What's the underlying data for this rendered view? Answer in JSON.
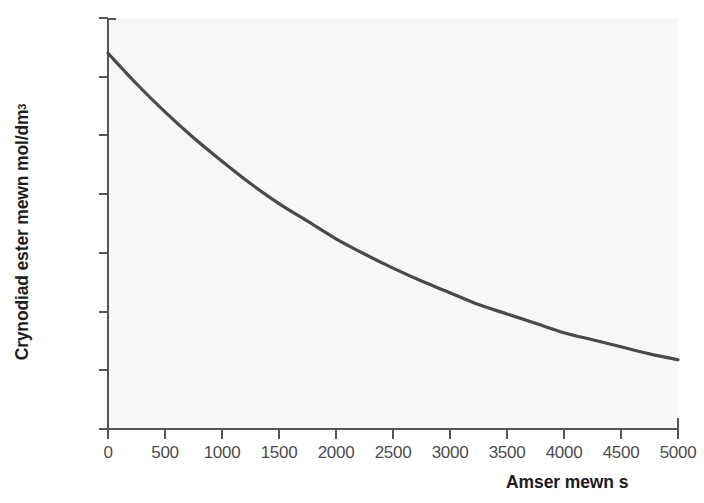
{
  "chart_data": {
    "type": "line",
    "title": "",
    "xlabel": "Amser mewn s",
    "ylabel_text": "Crynodiad ester mewn mol/dm",
    "ylabel_sup": "3",
    "xlim": [
      0,
      5000
    ],
    "ylim": [
      0.0,
      0.35
    ],
    "grid": false,
    "legend": null,
    "xticks": [
      0,
      500,
      1000,
      1500,
      2000,
      2500,
      3000,
      3500,
      4000,
      4500,
      5000
    ],
    "xtick_labels": [
      "0",
      "500",
      "1000",
      "1500",
      "2000",
      "2500",
      "3000",
      "3500",
      "4000",
      "4500",
      "5000"
    ],
    "yticks": [
      0.0,
      0.05,
      0.1,
      0.15,
      0.2,
      0.25,
      0.3,
      0.35
    ],
    "ytick_labels": [
      "0.0",
      "0.05",
      "0.10",
      "0.15",
      "0.20",
      "0.25",
      "0.30",
      "0.35"
    ],
    "series": [
      {
        "name": "Crynodiad ester",
        "color": "#4a4a4a",
        "x": [
          0,
          250,
          500,
          750,
          1000,
          1250,
          1500,
          1750,
          2000,
          2250,
          2500,
          2750,
          3000,
          3250,
          3500,
          3750,
          4000,
          4250,
          4500,
          4750,
          5000
        ],
        "y": [
          0.32,
          0.294,
          0.27,
          0.248,
          0.228,
          0.209,
          0.192,
          0.177,
          0.162,
          0.149,
          0.137,
          0.126,
          0.116,
          0.106,
          0.098,
          0.09,
          0.082,
          0.076,
          0.07,
          0.064,
          0.059
        ]
      }
    ]
  },
  "axes": {
    "x_title": "Amser mewn s",
    "y_title_main": "Crynodiad ester mewn mol/dm",
    "y_title_superscript": "3"
  },
  "colors": {
    "curve": "#4a4a4a",
    "axis": "#555555",
    "plot_background": "#f7f7f5",
    "tick_label": "#4d4d4d",
    "axis_title": "#1d1d1d"
  }
}
